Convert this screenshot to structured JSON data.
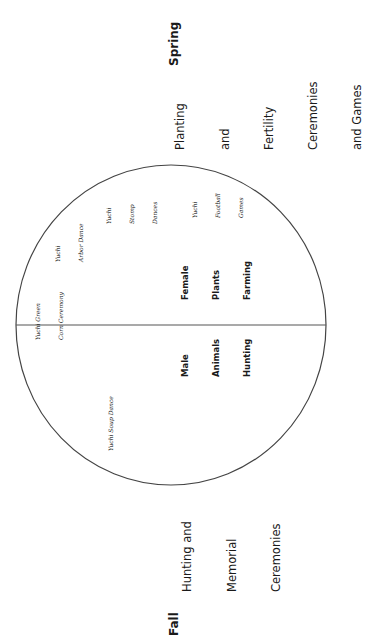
{
  "diagram": {
    "circle": {
      "cx": 171,
      "cy": 325,
      "rx": 155,
      "ry": 160,
      "stroke": "#444444"
    },
    "divider": {
      "y": 325,
      "x1": 16,
      "x2": 326,
      "stroke": "#555555"
    },
    "seasons": {
      "spring": "Spring",
      "fall": "Fall"
    },
    "ceremony_groups": {
      "spring": [
        "Planting",
        "and",
        "Fertility",
        "Ceremonies",
        "and Games"
      ],
      "fall": [
        "Hunting and",
        "Memorial",
        "Ceremonies"
      ]
    },
    "halves": {
      "female": [
        "Female",
        "Plants",
        "Farming"
      ],
      "male": [
        "Male",
        "Animals",
        "Hunting"
      ]
    },
    "events": {
      "green_corn": [
        "Yuchi Green",
        "Corn Ceremony"
      ],
      "arbor_dance": [
        "Yuchi",
        "Arbor Dance"
      ],
      "stomp_dances": [
        "Yuchi",
        "Stomp",
        "Dances"
      ],
      "football_games": [
        "Yuchi",
        "Football",
        "Games"
      ],
      "soup_dance": [
        "Yuchi Soup Dance"
      ]
    }
  }
}
